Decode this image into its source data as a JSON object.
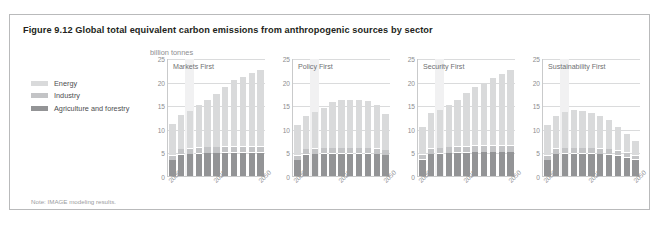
{
  "figure": {
    "title": "Figure 9.12 Global total equivalent carbon emissions from anthropogenic sources by sector",
    "unit": "billion tonnes",
    "note": "Note: IMAGE modeling results."
  },
  "legend": {
    "items": [
      {
        "label": "Energy",
        "color": "#d9dadb"
      },
      {
        "label": "Industry",
        "color": "#c3c4c6"
      },
      {
        "label": "Agriculture and forestry",
        "color": "#939496"
      }
    ]
  },
  "colors": {
    "frame": "#b9babb",
    "axis": "#c9cacb",
    "grid": "#dadbdc",
    "shade_band": "#f1f1f2",
    "tick_text": "#8d8e90",
    "panel_label": "#6f7072",
    "title_text": "#231f20"
  },
  "chart_data": {
    "type": "bar",
    "title": "Figure 9.12 Global total equivalent carbon emissions from anthropogenic sources by sector",
    "subtitle": "",
    "xlabel": "",
    "ylabel": "billion tonnes",
    "ylim": [
      0,
      25
    ],
    "yticks": [
      0,
      5,
      10,
      15,
      20,
      25
    ],
    "xticks_shown": [
      "2000",
      "2025",
      "2050"
    ],
    "categories": [
      "2000",
      "2005",
      "2010",
      "2015",
      "2020",
      "2025",
      "2030",
      "2035",
      "2040",
      "2045",
      "2050"
    ],
    "stacked": true,
    "grid": true,
    "legend_position": "left-outside",
    "series_order": [
      "Agriculture and forestry",
      "Industry",
      "Energy"
    ],
    "panels": [
      {
        "label": "Markets First",
        "series": [
          {
            "name": "Agriculture and forestry",
            "values": [
              3.3,
              4.5,
              4.6,
              4.7,
              4.8,
              4.8,
              4.9,
              4.9,
              4.9,
              4.9,
              4.9
            ]
          },
          {
            "name": "Industry",
            "values": [
              0.9,
              1.0,
              1.0,
              1.1,
              1.1,
              1.1,
              1.2,
              1.2,
              1.2,
              1.2,
              1.2
            ]
          },
          {
            "name": "Energy",
            "values": [
              6.5,
              7.1,
              7.9,
              8.9,
              10.0,
              11.2,
              12.5,
              13.9,
              14.6,
              15.4,
              16.1
            ]
          }
        ],
        "totals": [
          10.7,
          12.6,
          13.5,
          14.7,
          15.9,
          17.1,
          18.6,
          20.0,
          20.7,
          21.5,
          22.2
        ]
      },
      {
        "label": "Policy First",
        "series": [
          {
            "name": "Agriculture and forestry",
            "values": [
              3.3,
              4.5,
              4.6,
              4.7,
              4.7,
              4.7,
              4.7,
              4.7,
              4.7,
              4.6,
              4.4
            ]
          },
          {
            "name": "Industry",
            "values": [
              0.9,
              1.0,
              1.0,
              1.0,
              1.0,
              1.0,
              1.0,
              1.0,
              1.0,
              1.0,
              0.9
            ]
          },
          {
            "name": "Energy",
            "values": [
              6.3,
              6.9,
              7.7,
              8.5,
              9.6,
              10.1,
              10.2,
              10.2,
              9.9,
              9.1,
              7.6
            ]
          }
        ],
        "totals": [
          10.5,
          12.4,
          13.3,
          14.2,
          15.3,
          15.8,
          15.9,
          15.9,
          15.6,
          14.7,
          12.9
        ]
      },
      {
        "label": "Security First",
        "series": [
          {
            "name": "Agriculture and forestry",
            "values": [
              3.4,
              4.6,
              4.7,
              4.8,
              4.9,
              4.9,
              5.0,
              5.0,
              5.0,
              5.0,
              5.0
            ]
          },
          {
            "name": "Industry",
            "values": [
              0.9,
              1.0,
              1.0,
              1.1,
              1.1,
              1.1,
              1.2,
              1.2,
              1.2,
              1.2,
              1.2
            ]
          },
          {
            "name": "Energy",
            "values": [
              5.7,
              7.5,
              8.1,
              8.9,
              9.9,
              11.3,
              12.4,
              13.3,
              14.2,
              15.1,
              15.9
            ]
          }
        ],
        "totals": [
          10.0,
          13.1,
          13.8,
          14.8,
          15.9,
          17.3,
          18.6,
          19.5,
          20.4,
          21.3,
          22.1
        ]
      },
      {
        "label": "Sustainability First",
        "series": [
          {
            "name": "Agriculture and forestry",
            "values": [
              3.3,
              4.6,
              4.7,
              4.7,
              4.7,
              4.7,
              4.6,
              4.5,
              4.3,
              3.9,
              3.4
            ]
          },
          {
            "name": "Industry",
            "values": [
              0.9,
              1.0,
              1.0,
              1.0,
              1.0,
              1.0,
              1.0,
              1.0,
              0.9,
              0.9,
              0.8
            ]
          },
          {
            "name": "Energy",
            "values": [
              6.3,
              6.8,
              7.6,
              8.0,
              7.7,
              7.3,
              6.8,
              6.0,
              5.0,
              3.9,
              2.9
            ]
          }
        ],
        "totals": [
          10.5,
          12.4,
          13.3,
          13.7,
          13.4,
          13.0,
          12.4,
          11.5,
          10.2,
          8.7,
          7.1
        ]
      }
    ]
  }
}
